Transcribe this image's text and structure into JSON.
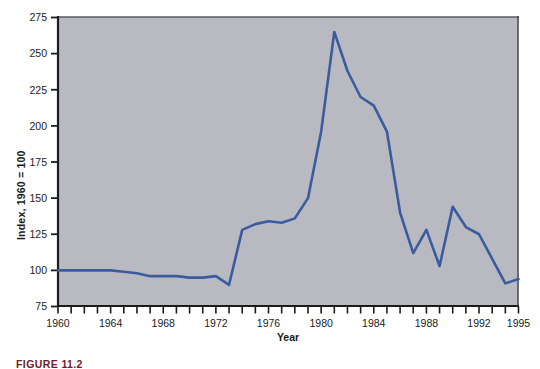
{
  "figure": {
    "caption": "FIGURE 11.2",
    "background_color": "#ffffff",
    "plot_background_color": "#b9b9c1",
    "line_color": "#3a5c9e",
    "axis_color": "#1b1b1b"
  },
  "chart_data": {
    "type": "line",
    "title": "",
    "subtitle": "",
    "xlabel": "Year",
    "ylabel": "Index, 1960 = 100",
    "xlim": [
      1960,
      1995
    ],
    "ylim": [
      75,
      275
    ],
    "yticks": [
      75,
      100,
      125,
      150,
      175,
      200,
      225,
      250,
      275
    ],
    "ytick_labels": [
      "75",
      "100",
      "125",
      "150",
      "175",
      "200",
      "225",
      "250",
      "275"
    ],
    "xticks": [
      1960,
      1961,
      1962,
      1963,
      1964,
      1965,
      1966,
      1967,
      1968,
      1969,
      1970,
      1971,
      1972,
      1973,
      1974,
      1975,
      1976,
      1977,
      1978,
      1979,
      1980,
      1981,
      1982,
      1983,
      1984,
      1985,
      1986,
      1987,
      1988,
      1989,
      1990,
      1991,
      1992,
      1993,
      1994,
      1995
    ],
    "xtick_labels_shown": [
      "1960",
      "1964",
      "1968",
      "1972",
      "1976",
      "1980",
      "1984",
      "1988",
      "1992",
      "1995"
    ],
    "xtick_label_years": [
      1960,
      1964,
      1968,
      1972,
      1976,
      1980,
      1984,
      1988,
      1992,
      1995
    ],
    "grid": false,
    "legend": null,
    "legend_position": "none",
    "series": [
      {
        "name": "Index, 1960 = 100",
        "color": "#3a5c9e",
        "x": [
          1960,
          1961,
          1962,
          1963,
          1964,
          1965,
          1966,
          1967,
          1968,
          1969,
          1970,
          1971,
          1972,
          1973,
          1974,
          1975,
          1976,
          1977,
          1978,
          1979,
          1980,
          1981,
          1982,
          1983,
          1984,
          1985,
          1986,
          1987,
          1988,
          1989,
          1990,
          1991,
          1992,
          1993,
          1994,
          1995
        ],
        "values": [
          100,
          100,
          100,
          100,
          100,
          99,
          98,
          96,
          96,
          96,
          95,
          95,
          96,
          90,
          128,
          132,
          134,
          133,
          136,
          150,
          196,
          265,
          238,
          220,
          214,
          196,
          140,
          112,
          128,
          103,
          144,
          130,
          125,
          108,
          91,
          94
        ]
      }
    ]
  }
}
